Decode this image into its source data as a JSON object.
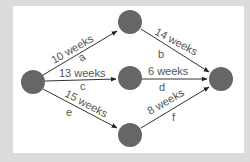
{
  "diagram": {
    "type": "activity-network",
    "colors": {
      "node": "#666666",
      "edge": "#333333",
      "text": "#555555",
      "background": "#dcdcdc",
      "panel": "#ffffff"
    },
    "nodes": [
      {
        "id": "start",
        "x": 33,
        "y": 82
      },
      {
        "id": "top",
        "x": 130,
        "y": 22
      },
      {
        "id": "middle",
        "x": 130,
        "y": 78
      },
      {
        "id": "bottom",
        "x": 130,
        "y": 135
      },
      {
        "id": "end",
        "x": 221,
        "y": 79
      }
    ],
    "edges": [
      {
        "from": "start",
        "to": "top",
        "duration": "10 weeks",
        "activity": "a"
      },
      {
        "from": "start",
        "to": "middle",
        "duration": "13 weeks",
        "activity": "c"
      },
      {
        "from": "start",
        "to": "bottom",
        "duration": "15 weeks",
        "activity": "e"
      },
      {
        "from": "top",
        "to": "end",
        "duration": "14 weeks",
        "activity": "b"
      },
      {
        "from": "middle",
        "to": "end",
        "duration": "6 weeks",
        "activity": "d"
      },
      {
        "from": "bottom",
        "to": "end",
        "duration": "8 weeks",
        "activity": "f"
      }
    ]
  }
}
